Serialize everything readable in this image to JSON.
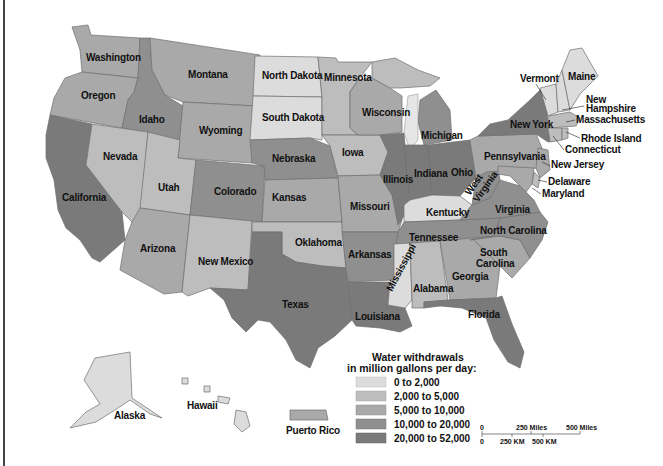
{
  "colors": {
    "c1": "#dcdcdc",
    "c2": "#bdbdbd",
    "c3": "#a9a9a9",
    "c4": "#8f8f8f",
    "c5": "#7a7a7a",
    "border": "#6f6f6f",
    "text": "#111111"
  },
  "states": {
    "washington": "Washington",
    "oregon": "Oregon",
    "california": "California",
    "idaho": "Idaho",
    "nevada": "Nevada",
    "montana": "Montana",
    "wyoming": "Wyoming",
    "utah": "Utah",
    "arizona": "Arizona",
    "colorado": "Colorado",
    "new_mexico": "New Mexico",
    "north_dakota": "North Dakota",
    "south_dakota": "South Dakota",
    "nebraska": "Nebraska",
    "kansas": "Kansas",
    "oklahoma": "Oklahoma",
    "texas": "Texas",
    "minnesota": "Minnesota",
    "iowa": "Iowa",
    "missouri": "Missouri",
    "arkansas": "Arkansas",
    "louisiana": "Louisiana",
    "wisconsin": "Wisconsin",
    "illinois": "Illinois",
    "michigan": "Michigan",
    "indiana": "Indiana",
    "ohio": "Ohio",
    "kentucky": "Kentucky",
    "tennessee": "Tennessee",
    "mississippi": "Mississippi",
    "alabama": "Alabama",
    "georgia": "Georgia",
    "florida": "Florida",
    "south_carolina_1": "South",
    "south_carolina_2": "Carolina",
    "north_carolina": "North Carolina",
    "virginia": "Virginia",
    "west_virginia_1": "West",
    "west_virginia_2": "Virginia",
    "pennsylvania": "Pennsylvania",
    "new_york": "New York",
    "vermont": "Vermont",
    "maine": "Maine",
    "new_hampshire_1": "New",
    "new_hampshire_2": "Hampshire",
    "massachusetts": "Massachusetts",
    "rhode_island": "Rhode Island",
    "connecticut": "Connecticut",
    "new_jersey": "New Jersey",
    "delaware": "Delaware",
    "maryland": "Maryland",
    "alaska": "Alaska",
    "hawaii": "Hawaii",
    "puerto_rico": "Puerto Rico"
  },
  "legend": {
    "title_line1": "Water withdrawals",
    "title_line2": "in million gallons per day:",
    "items": [
      {
        "label": "0 to 2,000",
        "color": "#dcdcdc"
      },
      {
        "label": "2,000 to 5,000",
        "color": "#bdbdbd"
      },
      {
        "label": "5,000 to 10,000",
        "color": "#a9a9a9"
      },
      {
        "label": "10,000 to 20,000",
        "color": "#8f8f8f"
      },
      {
        "label": "20,000 to 52,000",
        "color": "#7a7a7a"
      }
    ]
  },
  "scale": {
    "miles_0": "0",
    "miles_250": "250 Miles",
    "miles_500": "500 Miles",
    "km_0": "0",
    "km_250": "250 KM",
    "km_500": "500 KM"
  }
}
